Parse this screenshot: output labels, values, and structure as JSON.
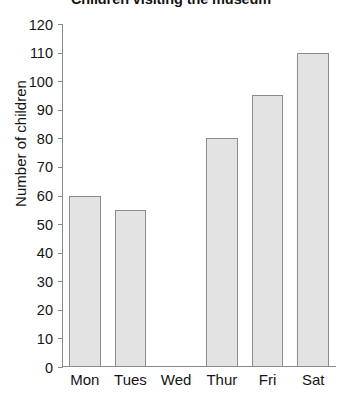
{
  "chart_data": {
    "type": "bar",
    "title": "Children visiting the museum",
    "xlabel": "",
    "ylabel": "Number of children",
    "categories": [
      "Mon",
      "Tues",
      "Wed",
      "Thur",
      "Fri",
      "Sat"
    ],
    "values": [
      60,
      55,
      0,
      80,
      95,
      110
    ],
    "ylim": [
      0,
      120
    ],
    "ytick_step": 10,
    "yticks": [
      0,
      10,
      20,
      30,
      40,
      50,
      60,
      70,
      80,
      90,
      100,
      110,
      120
    ],
    "ytick_labels": [
      "0",
      "10",
      "20",
      "30",
      "40",
      "50",
      "60",
      "70",
      "80",
      "90",
      "100",
      "110",
      "120"
    ],
    "grid": false,
    "legend": false,
    "bar_fill_color": "#e3e3e3",
    "bar_border_color": "#8c8c8c",
    "axis_color": "#8a8a8a"
  }
}
